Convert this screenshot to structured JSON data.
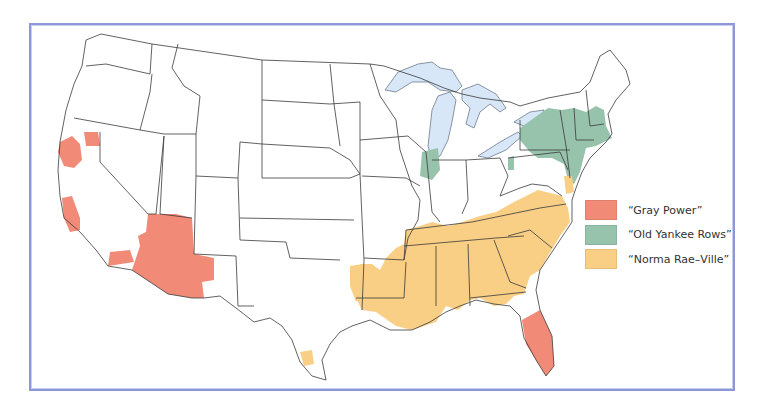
{
  "map": {
    "subject": "Contiguous United States",
    "base_fill": "#ffffff",
    "border_color": "#3a3a3a",
    "water_color": "#d8e7f7",
    "frame_color": "#8d96d6"
  },
  "legend": {
    "items": [
      {
        "label": "“Gray Power”",
        "color": "#f28a78"
      },
      {
        "label": "“Old Yankee Rows”",
        "color": "#97c3ad"
      },
      {
        "label": "“Norma Rae–Ville”",
        "color": "#f9cf86"
      }
    ]
  },
  "regions": {
    "gray_power": [
      "northern California",
      "coastal central California",
      "southern California",
      "Arizona",
      "southwest New Mexico",
      "Florida peninsula"
    ],
    "old_yankee_rows": [
      "New York",
      "Pennsylvania (east)",
      "New Jersey",
      "New England (south)",
      "northern Illinois"
    ],
    "norma_rae_ville": [
      "Virginia",
      "North Carolina",
      "South Carolina",
      "Georgia",
      "Tennessee",
      "Alabama",
      "Mississippi",
      "Louisiana",
      "Arkansas (south)",
      "east Texas",
      "south Texas",
      "Delaware/Maryland shore"
    ]
  }
}
